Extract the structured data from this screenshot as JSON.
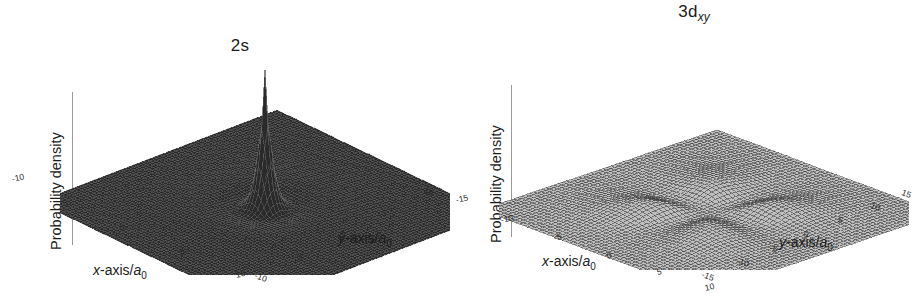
{
  "figure": {
    "panels": [
      {
        "id": "2s",
        "title_main": "2s",
        "title_sub": "",
        "vertical_axis_label": "Probability density",
        "x_axis_label_prefix": "x",
        "x_axis_label_rest": "-axis/",
        "x_axis_unit": "a",
        "x_axis_unit_sub": "0",
        "y_axis_label_prefix": "y",
        "y_axis_label_rest": "-axis/",
        "y_axis_unit": "a",
        "y_axis_unit_sub": "0",
        "x_ticks": [
          "-10",
          "-5",
          "0",
          "5",
          "10"
        ],
        "y_ticks": [
          "10",
          "5",
          "0",
          "-5",
          "-10"
        ],
        "corner_tick": "10"
      },
      {
        "id": "3dxy",
        "title_main": "3d",
        "title_sub": "xy",
        "vertical_axis_label": "Probability density",
        "x_axis_label_prefix": "x",
        "x_axis_label_rest": "-axis/",
        "x_axis_unit": "a",
        "x_axis_unit_sub": "0",
        "y_axis_label_prefix": "y",
        "y_axis_label_rest": "-axis/",
        "y_axis_unit": "a",
        "y_axis_unit_sub": "0",
        "x_ticks": [
          "-15",
          "-10",
          "-5",
          "0",
          "5",
          "10"
        ],
        "y_ticks": [
          "15",
          "10",
          "5",
          "0",
          "-5",
          "-10",
          "-15"
        ],
        "corner_tick": "15"
      }
    ]
  },
  "chart_data": [
    {
      "type": "surface",
      "title": "2s",
      "xlabel": "x-axis/a0",
      "ylabel": "y-axis/a0",
      "zlabel": "Probability density",
      "xlim": [
        -10,
        10
      ],
      "ylim": [
        -10,
        10
      ],
      "xticks": [
        -10,
        -5,
        0,
        5,
        10
      ],
      "yticks": [
        -10,
        -5,
        0,
        5,
        10
      ],
      "grid": false,
      "legend": "none",
      "description": "Hydrogen 2s orbital probability density surface: a tall narrow central spike at the origin surrounded by a low broad shoulder with a radial node ring, rendered as a dark dense wireframe mesh.",
      "features": {
        "central_peak_position": [
          0,
          0
        ],
        "central_peak_relative_height": 1.0,
        "secondary_shell_relative_height": 0.08,
        "radial_node_radius": 2.0
      }
    },
    {
      "type": "surface",
      "title": "3d_xy",
      "xlabel": "x-axis/a0",
      "ylabel": "y-axis/a0",
      "zlabel": "Probability density",
      "xlim": [
        -15,
        15
      ],
      "ylim": [
        -15,
        15
      ],
      "xticks": [
        -15,
        -10,
        -5,
        0,
        5,
        10,
        15
      ],
      "yticks": [
        -15,
        -10,
        -5,
        0,
        5,
        10,
        15
      ],
      "grid": false,
      "legend": "none",
      "description": "Hydrogen 3d_xy orbital probability density surface: four equal lobes arranged about the origin along the diagonals, rendered as a light gray wireframe mesh.",
      "features": {
        "lobe_positions": [
          [
            -5,
            -5
          ],
          [
            -5,
            5
          ],
          [
            5,
            -5
          ],
          [
            5,
            5
          ]
        ],
        "lobe_relative_height": 1.0,
        "nodal_planes": [
          "x=0",
          "y=0"
        ]
      }
    }
  ]
}
